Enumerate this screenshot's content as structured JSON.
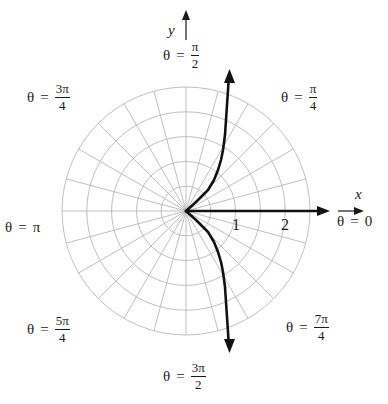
{
  "diagram": {
    "type": "polar graph",
    "center": {
      "x": 186,
      "y": 211
    },
    "grid": {
      "circle_count": 5,
      "circle_step_units": 0.5,
      "circle_step_px": 24.8,
      "radial_step_degrees": 15,
      "grid_color": "#b8b8b8"
    },
    "axes": {
      "x_label": "x",
      "y_label": "y"
    },
    "tick_labels": [
      {
        "value": "1",
        "x": 232,
        "y": 216
      },
      {
        "value": "2",
        "x": 281,
        "y": 216
      }
    ],
    "angle_labels": {
      "theta_0": {
        "prefix": "θ",
        "eq": "=",
        "value": "0"
      },
      "theta_pi4": {
        "prefix": "θ",
        "eq": "=",
        "num": "π",
        "den": "4"
      },
      "theta_pi2": {
        "prefix": "θ",
        "eq": "=",
        "num": "π",
        "den": "2"
      },
      "theta_3pi4": {
        "prefix": "θ",
        "eq": "=",
        "num": "3π",
        "den": "4"
      },
      "theta_pi": {
        "prefix": "θ",
        "eq": "=",
        "value": "π"
      },
      "theta_5pi4": {
        "prefix": "θ",
        "eq": "=",
        "num": "5π",
        "den": "4"
      },
      "theta_3pi2": {
        "prefix": "θ",
        "eq": "=",
        "num": "3π",
        "den": "2"
      },
      "theta_7pi4": {
        "prefix": "θ",
        "eq": "=",
        "num": "7π",
        "den": "4"
      }
    },
    "curve": {
      "color": "#111111",
      "upper_branch_points": [
        [
          186,
          211
        ],
        [
          196,
          202
        ],
        [
          208,
          190
        ],
        [
          214,
          180
        ],
        [
          218,
          170
        ],
        [
          221,
          160
        ],
        [
          223,
          150
        ],
        [
          225,
          135
        ],
        [
          226,
          120
        ],
        [
          227,
          105
        ],
        [
          228,
          90
        ],
        [
          229,
          75
        ]
      ],
      "lower_branch_points": [
        [
          186,
          211
        ],
        [
          196,
          220
        ],
        [
          208,
          232
        ],
        [
          214,
          242
        ],
        [
          218,
          252
        ],
        [
          221,
          262
        ],
        [
          223,
          272
        ],
        [
          225,
          287
        ],
        [
          226,
          302
        ],
        [
          227,
          317
        ],
        [
          228,
          332
        ],
        [
          229,
          347
        ]
      ],
      "ray": {
        "from": [
          186,
          211
        ],
        "to": [
          330,
          211
        ]
      }
    }
  }
}
